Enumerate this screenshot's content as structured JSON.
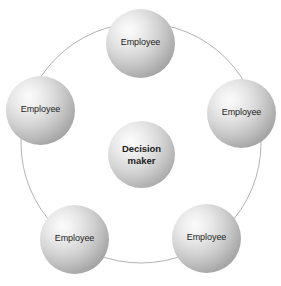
{
  "diagram": {
    "type": "circular-relationship",
    "background_color": "#ffffff",
    "width": 281,
    "height": 286,
    "ring": {
      "center_x": 141,
      "center_y": 143,
      "radius": 120,
      "stroke_color": "#b3b3b3",
      "stroke_width": 1
    },
    "center_node": {
      "label_line_1": "Decision",
      "label_line_2": "maker",
      "x": 108,
      "y": 121,
      "size": 67,
      "bold": true
    },
    "outer_nodes": [
      {
        "label": "Employee",
        "x": 106,
        "y": 9,
        "size": 69,
        "position": "top"
      },
      {
        "label": "Employee",
        "x": 207,
        "y": 79,
        "size": 69,
        "position": "right"
      },
      {
        "label": "Employee",
        "x": 172,
        "y": 204,
        "size": 69,
        "position": "bottom-right"
      },
      {
        "label": "Employee",
        "x": 40,
        "y": 205,
        "size": 69,
        "position": "bottom-left"
      },
      {
        "label": "Employee",
        "x": 6,
        "y": 76,
        "size": 69,
        "position": "left"
      }
    ]
  }
}
